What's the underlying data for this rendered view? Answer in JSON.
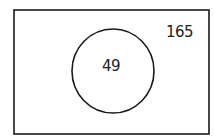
{
  "diagram": {
    "type": "venn",
    "universal_set": {
      "label": "165",
      "count": 165
    },
    "sets": [
      {
        "label": "49",
        "count": 49
      }
    ],
    "stroke_color": "#1a1a1a",
    "background": "#ffffff"
  }
}
